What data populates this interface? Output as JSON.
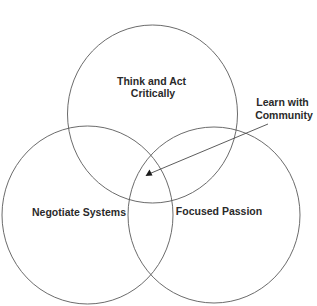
{
  "diagram": {
    "type": "venn",
    "sets": [
      {
        "id": "top",
        "label_lines": [
          "Think and Act",
          "Critically"
        ]
      },
      {
        "id": "left",
        "label_lines": [
          "Negotiate Systems"
        ]
      },
      {
        "id": "right",
        "label_lines": [
          "Focused Passion"
        ]
      }
    ],
    "intersection": {
      "sets": [
        "top",
        "left",
        "right"
      ],
      "label_lines": [
        "Learn with",
        "Community"
      ]
    },
    "colors": {
      "stroke": "#5a5a5a",
      "text": "#2a2a2a",
      "background": "#ffffff"
    }
  }
}
